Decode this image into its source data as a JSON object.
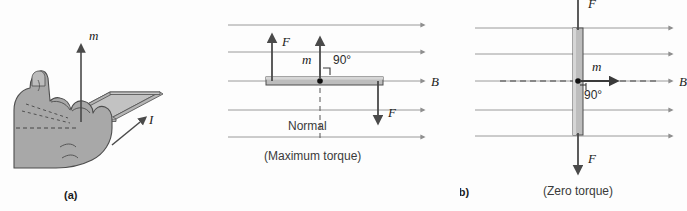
{
  "figure": {
    "title_panels": [
      {
        "id": "a",
        "caption": "(a)"
      },
      {
        "id": "b",
        "caption": "(b)"
      }
    ],
    "colors": {
      "field_line": "#9a9a9a",
      "arrow_dark": "#4a4a4a",
      "loop_fill": "#b8b8b8",
      "loop_stroke": "#555555",
      "hand_fill": "#a8a8a8",
      "hand_stroke": "#4d4d4d",
      "text": "#1a1a1a",
      "background": "#fdfdfd"
    }
  },
  "panel_a": {
    "name": "right-hand-rule-current-loop",
    "caption": "(a)",
    "labels": {
      "magnetic_moment": "m",
      "current": "I"
    },
    "icon_names": [
      "hand-grip-icon",
      "current-loop-icon",
      "moment-arrow-up-icon",
      "current-arrow-icon"
    ]
  },
  "panel_b_left": {
    "name": "maximum-torque-diagram",
    "labels": {
      "force_up": "F",
      "force_down": "F",
      "magnetic_moment": "m",
      "angle": "90°",
      "field": "B",
      "normal": "Normal",
      "condition": "(Maximum torque)"
    },
    "field_lines": 5,
    "icon_names": [
      "field-line-arrow-icon",
      "force-arrow-up-icon",
      "force-arrow-down-icon",
      "moment-arrow-up-icon",
      "right-angle-icon",
      "pivot-dot-icon",
      "loop-edge-on-icon"
    ]
  },
  "panel_b_right": {
    "name": "zero-torque-diagram",
    "labels": {
      "force_up": "F",
      "force_down": "F",
      "magnetic_moment": "m",
      "angle": "90°",
      "field": "B",
      "condition": "(Zero torque)"
    },
    "field_lines": 5,
    "caption": "(b)",
    "icon_names": [
      "field-line-arrow-icon",
      "force-arrow-up-icon",
      "force-arrow-down-icon",
      "moment-arrow-right-icon",
      "right-angle-icon",
      "pivot-dot-icon",
      "loop-edge-on-vertical-icon"
    ]
  }
}
